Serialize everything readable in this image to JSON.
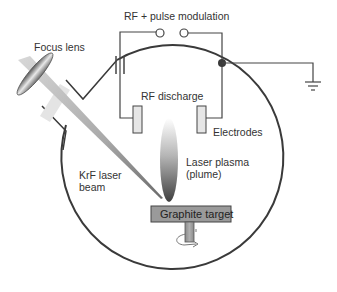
{
  "diagram": {
    "type": "schematic",
    "labels": {
      "rf_modulation": "RF + pulse modulation",
      "focus_lens": "Focus lens",
      "rf_discharge": "RF discharge",
      "electrodes": "Electrodes",
      "krf_line1": "KrF laser",
      "krf_line2": "beam",
      "plasma_line1": "Laser plasma",
      "plasma_line2": "(plume)",
      "target": "Graphite target"
    },
    "components": [
      {
        "id": "chamber",
        "shape": "circle"
      },
      {
        "id": "focus-lens",
        "shape": "ellipse"
      },
      {
        "id": "laser-beam",
        "shape": "tapered-wedge"
      },
      {
        "id": "capacitor",
        "shape": "two-plates"
      },
      {
        "id": "terminals",
        "shape": "two-open-circles"
      },
      {
        "id": "junction",
        "shape": "filled-dot"
      },
      {
        "id": "ground",
        "shape": "ground-symbol"
      },
      {
        "id": "electrode-left",
        "shape": "rect"
      },
      {
        "id": "electrode-right",
        "shape": "rect"
      },
      {
        "id": "plume",
        "shape": "gradient-ellipse"
      },
      {
        "id": "graphite-target",
        "shape": "rect"
      },
      {
        "id": "rotation-shaft",
        "shape": "rect-with-arrow"
      }
    ],
    "colors": {
      "line": "#444444",
      "chamber": "#3a3a3a",
      "target_fill": "#9a9a9a",
      "electrode_fill": "#e6e6e6",
      "plume_dark": "#4a4a4a",
      "plume_light": "#ffffff"
    }
  }
}
